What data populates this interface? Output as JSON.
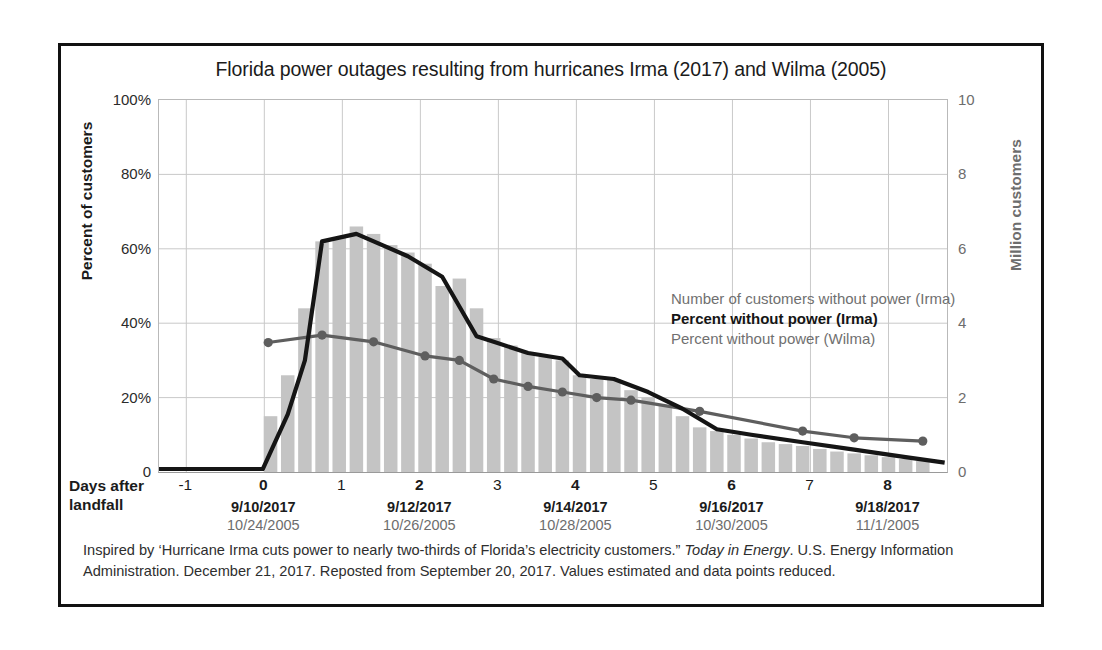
{
  "figure": {
    "title": "Florida power outages resulting from hurricanes Irma (2017) and Wilma (2005)",
    "caption_part1": "Inspired by ‘Hurricane Irma cuts power to nearly two-thirds of Florida’s electricity customers.” ",
    "caption_italic": "Today in Energy",
    "caption_part2": ". U.S. Energy Information Administration. December 21, 2017. Reposted from September 20, 2017. Values estimated and data points reduced."
  },
  "axes": {
    "left_title": "Percent of customers",
    "right_title": "Million customers",
    "x_title_line1": "Days after",
    "x_title_line2": "landfall",
    "left_ticks": [
      "0",
      "20%",
      "40%",
      "60%",
      "80%",
      "100%"
    ],
    "right_ticks": [
      "0",
      "2",
      "4",
      "6",
      "8",
      "10"
    ],
    "x_ticks": [
      {
        "day": "-1",
        "value": -1,
        "major": false,
        "date_2017": "",
        "date_2005": ""
      },
      {
        "day": "0",
        "value": 0,
        "major": true,
        "date_2017": "9/10/2017",
        "date_2005": "10/24/2005"
      },
      {
        "day": "1",
        "value": 1,
        "major": false,
        "date_2017": "",
        "date_2005": ""
      },
      {
        "day": "2",
        "value": 2,
        "major": true,
        "date_2017": "9/12/2017",
        "date_2005": "10/26/2005"
      },
      {
        "day": "3",
        "value": 3,
        "major": false,
        "date_2017": "",
        "date_2005": ""
      },
      {
        "day": "4",
        "value": 4,
        "major": true,
        "date_2017": "9/14/2017",
        "date_2005": "10/28/2005"
      },
      {
        "day": "5",
        "value": 5,
        "major": false,
        "date_2017": "",
        "date_2005": ""
      },
      {
        "day": "6",
        "value": 6,
        "major": true,
        "date_2017": "9/16/2017",
        "date_2005": "10/30/2005"
      },
      {
        "day": "7",
        "value": 7,
        "major": false,
        "date_2017": "",
        "date_2005": ""
      },
      {
        "day": "8",
        "value": 8,
        "major": true,
        "date_2017": "9/18/2017",
        "date_2005": "11/1/2005"
      }
    ]
  },
  "legend": {
    "position": "inside-upper-right",
    "entries": [
      {
        "label": "Number of customers without power (Irma)",
        "style": "bars",
        "color": "#c4c4c4"
      },
      {
        "label": "Percent without power (Irma)",
        "style": "irma",
        "color": "#151515"
      },
      {
        "label": "Percent without power (Wilma)",
        "style": "wilma",
        "color": "#5e5e5e"
      }
    ]
  },
  "colors": {
    "bar_fill": "#c4c4c4",
    "irma_line": "#151515",
    "wilma_line": "#5e5e5e",
    "grid": "#c9c9c9",
    "frame": "#111111",
    "muted_text": "#6d6d6d"
  },
  "chart_data": {
    "type": "bar",
    "title": "Florida power outages resulting from hurricanes Irma (2017) and Wilma (2005)",
    "xlabel": "Days after landfall",
    "ylabel": "Percent of customers",
    "y2label": "Million customers",
    "xlim": [
      -1.35,
      8.75
    ],
    "ylim": [
      0,
      100
    ],
    "y2lim": [
      0,
      10
    ],
    "grid": true,
    "legend_position": "inside-upper-right",
    "x_tick_values": [
      -1,
      0,
      1,
      2,
      3,
      4,
      5,
      6,
      7,
      8
    ],
    "series": [
      {
        "name": "Number of customers without power (Irma)",
        "type": "bar",
        "axis": "right",
        "unit": "million customers",
        "x": [
          0.08,
          0.3,
          0.52,
          0.74,
          0.96,
          1.18,
          1.4,
          1.62,
          1.84,
          2.06,
          2.28,
          2.5,
          2.72,
          2.94,
          3.16,
          3.38,
          3.6,
          3.82,
          4.04,
          4.26,
          4.48,
          4.7,
          4.92,
          5.14,
          5.36,
          5.58,
          5.8,
          6.02,
          6.24,
          6.46,
          6.68,
          6.9,
          7.12,
          7.34,
          7.56,
          7.78,
          8.0,
          8.22,
          8.44
        ],
        "values": [
          1.5,
          2.6,
          4.4,
          6.2,
          6.3,
          6.6,
          6.4,
          6.1,
          5.9,
          5.6,
          5.0,
          5.2,
          4.4,
          3.6,
          3.4,
          3.2,
          3.1,
          3.0,
          2.6,
          2.5,
          2.5,
          2.2,
          2.0,
          1.8,
          1.5,
          1.2,
          1.1,
          1.0,
          0.9,
          0.8,
          0.75,
          0.7,
          0.62,
          0.55,
          0.5,
          0.45,
          0.4,
          0.35,
          0.3
        ]
      },
      {
        "name": "Percent without power (Irma)",
        "type": "line",
        "axis": "left",
        "unit": "percent",
        "x": [
          -1.35,
          -0.02,
          0.3,
          0.52,
          0.74,
          1.18,
          1.84,
          2.28,
          2.72,
          2.94,
          3.38,
          3.82,
          4.04,
          4.48,
          4.92,
          5.36,
          5.8,
          6.24,
          6.9,
          7.56,
          8.22,
          8.72
        ],
        "values": [
          0.8,
          0.8,
          15.5,
          30.0,
          62.0,
          64.0,
          58.0,
          52.5,
          36.5,
          35.0,
          32.0,
          30.5,
          26.0,
          25.0,
          21.5,
          17.0,
          11.5,
          10.0,
          8.0,
          6.0,
          4.0,
          2.5
        ]
      },
      {
        "name": "Percent without power (Wilma)",
        "type": "line-markers",
        "axis": "left",
        "unit": "percent",
        "x": [
          0.05,
          0.74,
          1.4,
          2.06,
          2.5,
          2.94,
          3.38,
          3.82,
          4.26,
          4.7,
          5.58,
          6.9,
          7.56,
          8.44
        ],
        "values": [
          34.8,
          36.8,
          35.0,
          31.2,
          30.0,
          25.0,
          23.0,
          21.5,
          20.0,
          19.3,
          16.3,
          11.0,
          9.2,
          8.3
        ]
      }
    ]
  }
}
